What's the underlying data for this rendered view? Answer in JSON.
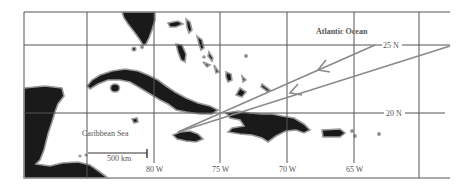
{
  "map": {
    "labels": {
      "atlantic": "Atlantic Ocean",
      "caribbean": "Caribbean Sea",
      "scale": "500 km"
    },
    "latitudes": [
      {
        "label": "25 N"
      },
      {
        "label": "20 N"
      }
    ],
    "longitudes": [
      {
        "label": "80 W"
      },
      {
        "label": "75 W"
      },
      {
        "label": "70 W"
      },
      {
        "label": "65 W"
      }
    ],
    "tracks": [
      {
        "name": "upper-track",
        "from": "25 N, ~63 W",
        "to": "~18 N, ~78 W"
      },
      {
        "name": "lower-track",
        "from": "25 N, ~60 W",
        "to": "~18 N, ~78 W"
      }
    ],
    "colors": {
      "land": "#1a1a1a",
      "coast": "#9a9a9a",
      "grid": "#555555",
      "track": "#8a8a8a"
    }
  }
}
